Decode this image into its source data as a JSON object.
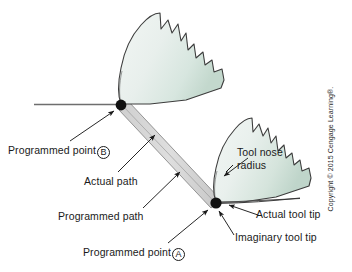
{
  "figure": {
    "background_color": "#ffffff"
  },
  "colors": {
    "tool_fill_light": "#eef3f1",
    "tool_fill_mid": "#dfeae5",
    "tool_fill_dark": "#c8dcd3",
    "tool_outline": "#3c3c3c",
    "path_band_fill": "#d8d8d8",
    "path_band_edge": "#7a7a7a",
    "reference_line": "#6e6e6e",
    "point_marker": "#111111",
    "leader_line": "#1a1a1a",
    "text": "#1a1a1a"
  },
  "labels": {
    "programmed_point_b": {
      "text": "Programmed point",
      "marker": "B"
    },
    "actual_path": {
      "text": "Actual path"
    },
    "programmed_path": {
      "text": "Programmed path"
    },
    "programmed_point_a": {
      "text": "Programmed point",
      "marker": "A"
    },
    "tool_nose_radius": {
      "line1": "Tool nose",
      "line2": "radius"
    },
    "actual_tool_tip": {
      "text": "Actual tool tip"
    },
    "imaginary_tool_tip": {
      "text": "Imaginary tool tip"
    }
  },
  "attribution": {
    "text": "Copyright © 2015 Cengage Learning®."
  },
  "points": {
    "point_b": {
      "x": 121,
      "y": 105
    },
    "point_a": {
      "x": 216,
      "y": 203
    }
  }
}
